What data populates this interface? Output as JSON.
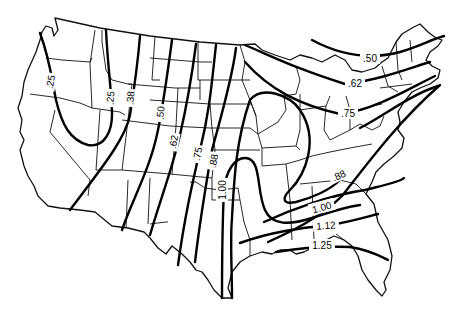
{
  "map": {
    "region": "Contiguous United States",
    "description": "Isoline map with labeled contour values",
    "line_color": "#000000",
    "background_color": "#ffffff",
    "isolines": [
      {
        "id": "iso-025-west",
        "value": ".25"
      },
      {
        "id": "iso-025-loop",
        "value": ".25"
      },
      {
        "id": "iso-038",
        "value": ".38"
      },
      {
        "id": "iso-050-west",
        "value": ".50"
      },
      {
        "id": "iso-062-west",
        "value": ".62"
      },
      {
        "id": "iso-075-west",
        "value": ".75"
      },
      {
        "id": "iso-088-west",
        "value": ".88"
      },
      {
        "id": "iso-100-central",
        "value": "1.00"
      },
      {
        "id": "iso-050-northeast",
        "value": ".50"
      },
      {
        "id": "iso-062-northeast",
        "value": ".62"
      },
      {
        "id": "iso-075-northeast",
        "value": ".75"
      },
      {
        "id": "iso-088-east",
        "value": ".88"
      },
      {
        "id": "iso-100-southeast",
        "value": "1.00"
      },
      {
        "id": "iso-112",
        "value": "1.12"
      },
      {
        "id": "iso-125",
        "value": "1.25"
      }
    ]
  }
}
